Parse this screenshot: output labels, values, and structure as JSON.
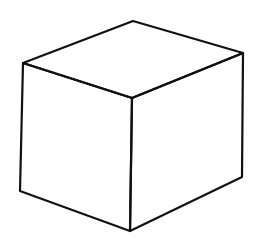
{
  "figure": {
    "stroke_color": "#111111",
    "background": "#ffffff",
    "vertices": {
      "top_back": [
        133,
        21
      ],
      "top_left": [
        23,
        63
      ],
      "top_right": [
        243,
        53
      ],
      "top_front": [
        132,
        98
      ],
      "bottom_left": [
        20,
        191
      ],
      "bottom_front": [
        130,
        231
      ],
      "bottom_right": [
        242,
        177
      ]
    }
  }
}
